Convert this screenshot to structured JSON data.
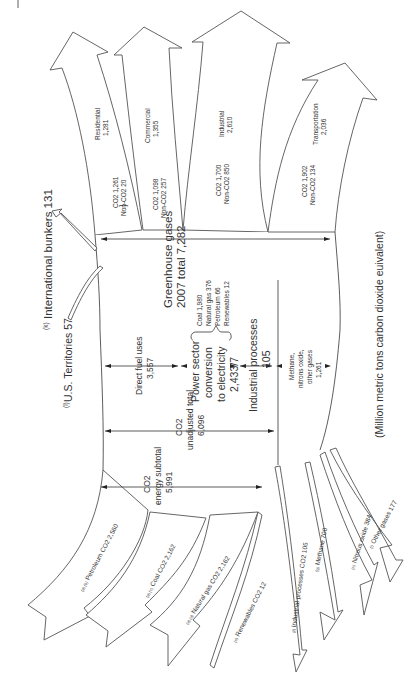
{
  "diagram": {
    "title": "Greenhouse gases 2007 total 7,282",
    "title_line1": "Greenhouse gases",
    "title_line2": "2007 total 7,282",
    "units": "(Million metric tons carbon dioxide euivalent)",
    "orientation": "rotated 90° counter-clockwise; inflows at bottom, outflows at top"
  },
  "inflows": [
    {
      "note": "(a) (b)",
      "label": "Petroleum CO2 2,560",
      "name": "Petroleum CO",
      "sub": "2",
      "value": "2,560"
    },
    {
      "note": "(a) (c)",
      "label": "Coal CO2 2,162",
      "name": "Coal CO",
      "sub": "2",
      "value": "2,162"
    },
    {
      "note": "(a) (d)",
      "label": "Natural gas CO2 2,162",
      "name": "Natural gas CO",
      "sub": "2",
      "value": "2,162"
    },
    {
      "note": "(e)",
      "label": "Renewables CO2 12",
      "name": "Renewables CO",
      "sub": "2",
      "value": "12"
    },
    {
      "note": "(f)",
      "label": "Industrial processes CO2 105",
      "name": "Industrial processes CO",
      "sub": "2",
      "value": "105"
    },
    {
      "note": "(g)",
      "label": "Methane 700",
      "name": "Methane",
      "sub": "",
      "value": "700"
    },
    {
      "note": "(h)",
      "label": "Nitrous oxide 384",
      "name": "Nitrous oxide",
      "sub": "",
      "value": "384"
    },
    {
      "note": "(i)",
      "label": "Other gases 177",
      "name": "Other gases",
      "sub": "",
      "value": "177"
    }
  ],
  "adjustments": {
    "us_territories": {
      "note": "(l)",
      "label": "U.S. Territories 57"
    },
    "international_bunkers": {
      "note": "(k)",
      "label": "International bunkers 131"
    }
  },
  "middle": {
    "co2_energy_subtotal": {
      "line1": "CO2",
      "line2": "energy subtotal",
      "value": "5,991"
    },
    "co2_unadjusted_total": {
      "line1": "CO2",
      "line2": "unadjusted total",
      "value": "6,096"
    },
    "direct_fuel_uses": {
      "line1": "Direct fuel uses",
      "value": "3,557"
    },
    "power_sector": {
      "line1": "Power sector",
      "line2": "conversion",
      "line3": "to electricity",
      "value": "2,433/7"
    },
    "power_sources": [
      "Coal 1,980",
      "Natural gas 376",
      "Petroleum 66",
      "Renewables 12"
    ],
    "industrial_processes": {
      "line1": "Industrial processes",
      "value": "105"
    },
    "other_gases": {
      "line1": "Methane,",
      "line2": "nitrons oxide,",
      "line3": "other gases",
      "value": "1,261"
    }
  },
  "outflows": [
    {
      "sector": "Residential",
      "total": "1,281",
      "co2": "CO2 1,261",
      "non_co2_note": "(m)",
      "non_co2": "Non-CO2 20"
    },
    {
      "sector": "Commercial",
      "total": "1,355",
      "co2": "CO2 1,098",
      "non_co2_note": "(m)",
      "non_co2": "Non-CO2 257"
    },
    {
      "sector": "Industrial",
      "total": "2,610",
      "co2": "CO2 1,700",
      "non_co2_note": "(m)",
      "non_co2": "Non-CO2 850"
    },
    {
      "sector": "Transportation",
      "total": "2,036",
      "co2": "CO2 1,902",
      "non_co2_note": "(n)",
      "non_co2": "Non-CO2 134"
    }
  ],
  "colors": {
    "stroke": "#555555",
    "text": "#333333",
    "background": "#ffffff"
  }
}
